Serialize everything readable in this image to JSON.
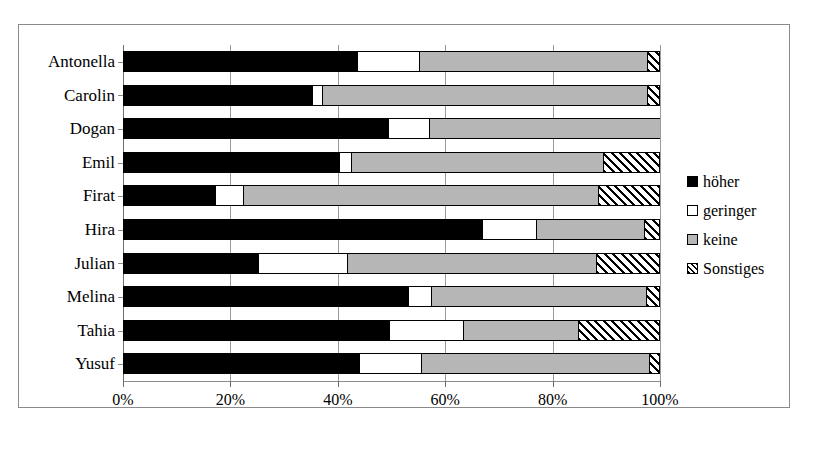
{
  "chart_data": {
    "type": "bar",
    "subtype": "stacked-horizontal-100percent",
    "title": "",
    "xlabel": "",
    "ylabel": "",
    "xlim": [
      0,
      100
    ],
    "xticks": [
      "0%",
      "20%",
      "40%",
      "60%",
      "80%",
      "100%"
    ],
    "xtick_values": [
      0,
      20,
      40,
      60,
      80,
      100
    ],
    "grid": true,
    "legend_position": "right",
    "categories": [
      "Antonella",
      "Carolin",
      "Dogan",
      "Emil",
      "Firat",
      "Hira",
      "Julian",
      "Melina",
      "Tahia",
      "Yusuf"
    ],
    "series": [
      {
        "name": "höher",
        "color": "#000000",
        "pattern": "solid-black",
        "values": [
          43.6,
          35.2,
          49.3,
          40.2,
          17.1,
          66.9,
          25.1,
          53.1,
          49.5,
          44.0
        ]
      },
      {
        "name": "geringer",
        "color": "#ffffff",
        "pattern": "solid-white",
        "values": [
          11.5,
          1.9,
          7.6,
          2.2,
          5.2,
          10.1,
          16.6,
          4.3,
          13.8,
          11.5
        ]
      },
      {
        "name": "keine",
        "color": "#b6b6b6",
        "pattern": "solid-gray",
        "values": [
          42.5,
          60.5,
          43.1,
          46.9,
          66.1,
          20.0,
          46.4,
          40.0,
          21.4,
          42.5
        ]
      },
      {
        "name": "Sonstiges",
        "color": "#ffffff",
        "pattern": "diagonal-hatch",
        "values": [
          2.4,
          2.4,
          0.0,
          10.7,
          11.6,
          3.0,
          12.0,
          2.6,
          15.3,
          2.0
        ]
      }
    ]
  },
  "legend": {
    "items": [
      {
        "label": "höher",
        "swatch": "solid-black"
      },
      {
        "label": "geringer",
        "swatch": "solid-white"
      },
      {
        "label": "keine",
        "swatch": "solid-gray"
      },
      {
        "label": "Sonstiges",
        "swatch": "diagonal-hatch"
      }
    ]
  }
}
